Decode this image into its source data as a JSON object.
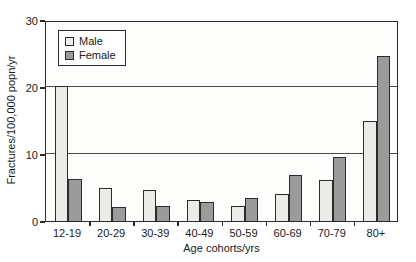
{
  "chart_data": {
    "type": "bar",
    "title": "",
    "categories": [
      "12-19",
      "20-29",
      "30-39",
      "40-49",
      "50-59",
      "60-69",
      "70-79",
      "80+"
    ],
    "series": [
      {
        "name": "Male",
        "color": "#ebebe7",
        "values": [
          20.2,
          4.9,
          4.6,
          3.2,
          2.3,
          4.0,
          6.1,
          14.9
        ]
      },
      {
        "name": "Female",
        "color": "#9b9b9b",
        "values": [
          6.3,
          2.1,
          2.3,
          2.9,
          3.5,
          6.8,
          9.5,
          24.6
        ]
      }
    ],
    "xlabel": "Age cohorts/yrs",
    "ylabel": "Fractures/100,000 popn/yr",
    "ylim": [
      0,
      30
    ],
    "yticks": [
      0,
      10,
      20,
      30
    ],
    "grid": true,
    "legend_position": "top-left",
    "axis_color": "#2b2b2b",
    "grid_color": "#4d4d4d",
    "background": "#ffffff"
  }
}
